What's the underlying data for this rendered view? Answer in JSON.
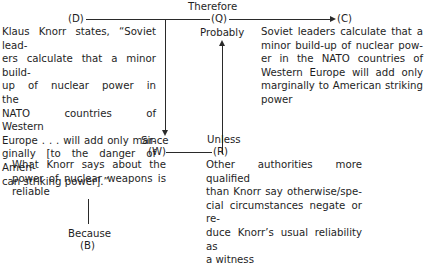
{
  "diagram": {
    "type": "toulmin-argument",
    "connectors": {
      "therefore": "Therefore",
      "probably": "Probably",
      "since": "Since",
      "unless": "Unless",
      "because": "Because"
    },
    "labels": {
      "D": "(D)",
      "Q": "(Q)",
      "C": "(C)",
      "W": "(W)",
      "R": "(R)",
      "B": "(B)"
    },
    "data_text": "Klaus Knorr states, “Soviet leaders calculate that a minor build-up of nuclear power in the NATO countries of Western Europe . . . will add only marginally [to the danger of American striking power].”",
    "data_lines": [
      "Klaus Knorr states, “Soviet lead-",
      "ers calculate that a minor build-",
      "up of nuclear power in the",
      "NATO countries of Western",
      "Europe . . . will add only mar-",
      "ginally [to the danger of Ameri-",
      "can striking power].”"
    ],
    "claim_lines": [
      "Soviet leaders calculate that a",
      "minor build-up of nuclear pow-",
      "er in the NATO countries of",
      "Western Europe will add only",
      "marginally to American striking",
      "power"
    ],
    "warrant_lines": [
      "What Knorr says about the",
      "power of nuclear weapons is",
      "reliable"
    ],
    "rebuttal_lines": [
      "Other authorities more qualified",
      "than Knorr say otherwise/spe-",
      "cial circumstances negate or re-",
      "duce Knorr’s usual reliability as",
      "a witness"
    ]
  }
}
